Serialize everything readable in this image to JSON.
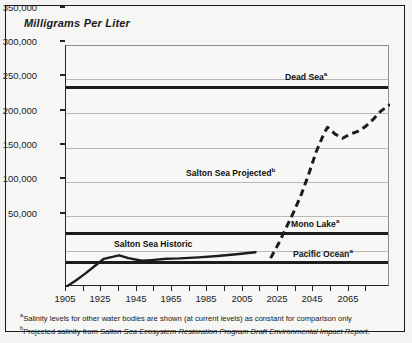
{
  "chart_data": {
    "type": "line",
    "title": "Milligrams Per Liter",
    "ylabel": "Milligrams Per Liter",
    "xlabel": "",
    "ylim": [
      0,
      350000
    ],
    "xlim": [
      1905,
      2076
    ],
    "grid": true,
    "legend": "inline-labels",
    "ytick_labels": [
      "350,000",
      "300,000",
      "250,000",
      "200,000",
      "150,000",
      "100,000",
      "50,000"
    ],
    "ytick_values": [
      350000,
      300000,
      250000,
      200000,
      150000,
      100000,
      50000
    ],
    "xtick_labels": [
      "1905",
      "1925",
      "1945",
      "1965",
      "1985",
      "2005",
      "2025",
      "2045",
      "2065"
    ],
    "xtick_values": [
      1905,
      1925,
      1945,
      1965,
      1985,
      2005,
      2025,
      2045,
      2065
    ],
    "xtick_minor_values": [
      1915,
      1935,
      1955,
      1975,
      1995,
      2015,
      2035,
      2055,
      2075
    ],
    "series": [
      {
        "name": "Salton Sea Historic",
        "style": "solid",
        "label": "Salton Sea Historic",
        "label_superscript": "",
        "x": [
          1905,
          1910,
          1915,
          1920,
          1925,
          1930,
          1933,
          1938,
          1945,
          1950,
          1958,
          1965,
          1975,
          1985,
          1995,
          2005
        ],
        "y": [
          0,
          9000,
          19000,
          30000,
          41000,
          44000,
          46000,
          42000,
          38000,
          39000,
          41000,
          41500,
          43000,
          45000,
          47500,
          50500
        ]
      },
      {
        "name": "Salton Sea Projected",
        "style": "dashed",
        "label": "Salton Sea Projected",
        "label_superscript": "b",
        "x": [
          2013,
          2017,
          2021,
          2025,
          2029,
          2033,
          2037,
          2041,
          2043,
          2047,
          2051,
          2055,
          2059,
          2063,
          2067,
          2071,
          2076
        ],
        "y": [
          42000,
          62000,
          85000,
          108000,
          133000,
          163000,
          196000,
          222000,
          232000,
          222000,
          216000,
          222000,
          226000,
          233000,
          243000,
          255000,
          265000
        ]
      },
      {
        "name": "Dead Sea",
        "style": "constant-thick",
        "label": "Dead Sea",
        "label_superscript": "a",
        "value": 290000
      },
      {
        "name": "Mono Lake",
        "style": "constant-thick",
        "label": "Mono Lake",
        "label_superscript": "a",
        "value": 78000
      },
      {
        "name": "Pacific Ocean",
        "style": "constant-thick",
        "label": "Pacific Ocean",
        "label_superscript": "a",
        "value": 35000
      }
    ]
  },
  "labels": {
    "dead_sea": "Dead Sea",
    "dead_sea_sup": "a",
    "mono_lake": "Mono Lake",
    "mono_lake_sup": "a",
    "pacific_ocean": "Pacific Ocean",
    "pacific_ocean_sup": "a",
    "salton_historic": "Salton Sea Historic",
    "salton_projected": "Salton Sea Projected",
    "salton_projected_sup": "b"
  },
  "footnotes": {
    "a_marker": "a",
    "a_text": "Salinity levels for other water bodies are shown (at current levels) as constant for comparison only",
    "b_marker": "b",
    "b_prefix": "Projected salinity from ",
    "b_italic": "Salton Sea Ecosystem Restoration Program Draft Environmental Impact Report",
    "b_suffix": "."
  },
  "colors": {
    "line": "#1c1c1c",
    "grid": "#b9b9b9",
    "plot_bg": "#f7f7f5",
    "frame": "#1a1a1a"
  }
}
